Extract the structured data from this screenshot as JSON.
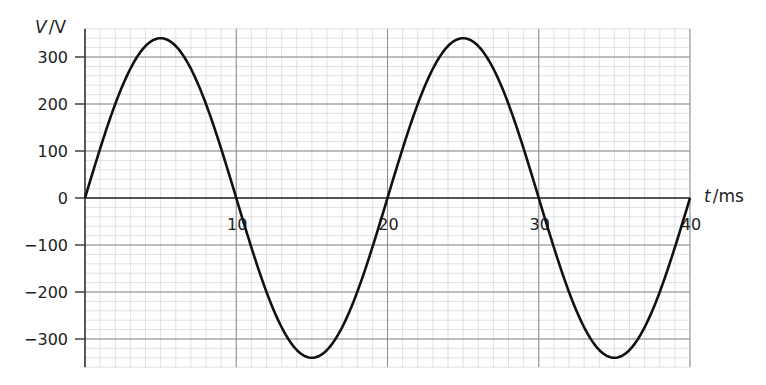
{
  "chart_data": {
    "type": "line",
    "title": "",
    "xlabel": "t / ms",
    "xlabel_var": "t",
    "xlabel_unit": "ms",
    "ylabel": "V / V",
    "ylabel_var": "V",
    "ylabel_unit": "V",
    "xlim": [
      0,
      40
    ],
    "ylim": [
      -360,
      360
    ],
    "x_ticks": [
      10,
      20,
      30,
      40
    ],
    "x_tick_labels": [
      "10",
      "20",
      "30",
      "40"
    ],
    "y_ticks": [
      300,
      200,
      100,
      0,
      -100,
      -200,
      -300
    ],
    "y_tick_labels": [
      "300",
      "200",
      "100",
      "0",
      "−100",
      "−200",
      "−300"
    ],
    "grid": true,
    "minor_grid": {
      "x_step": 1,
      "y_step": 20
    },
    "major_grid": {
      "x_step": 10,
      "y_step": 100
    },
    "series": [
      {
        "name": "V(t)",
        "function": "sine",
        "amplitude": 340,
        "period": 20,
        "phase": 0,
        "color": "#111111",
        "x": [
          0,
          5,
          10,
          15,
          20,
          25,
          30,
          35,
          40
        ],
        "values": [
          0,
          340,
          0,
          -340,
          0,
          340,
          0,
          -340,
          0
        ]
      }
    ]
  }
}
